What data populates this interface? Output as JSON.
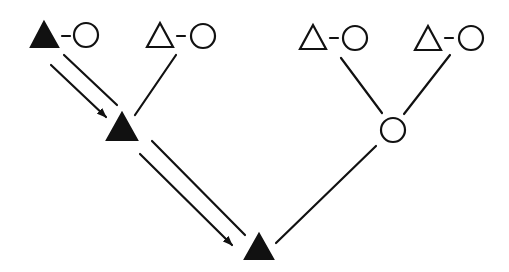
{
  "diagram": {
    "type": "pedigree",
    "colors": {
      "stroke": "#111111",
      "fill_affected": "#111111",
      "background": "#ffffff"
    },
    "nodes": [
      {
        "id": "g1_left_male",
        "shape": "triangle",
        "filled": true,
        "x": 44,
        "y": 35
      },
      {
        "id": "g1_left_female",
        "shape": "circle",
        "filled": false,
        "x": 86,
        "y": 35
      },
      {
        "id": "g1_mid_male",
        "shape": "triangle",
        "filled": false,
        "x": 160,
        "y": 35
      },
      {
        "id": "g1_mid_female",
        "shape": "circle",
        "filled": false,
        "x": 203,
        "y": 35
      },
      {
        "id": "g1_r1_male",
        "shape": "triangle",
        "filled": false,
        "x": 313,
        "y": 37
      },
      {
        "id": "g1_r1_female",
        "shape": "circle",
        "filled": false,
        "x": 355,
        "y": 37
      },
      {
        "id": "g1_r2_male",
        "shape": "triangle",
        "filled": false,
        "x": 428,
        "y": 37
      },
      {
        "id": "g1_r2_female",
        "shape": "circle",
        "filled": false,
        "x": 471,
        "y": 37
      },
      {
        "id": "g2_left_male",
        "shape": "triangle",
        "filled": true,
        "x": 122,
        "y": 127
      },
      {
        "id": "g2_right_female",
        "shape": "circle",
        "filled": false,
        "x": 393,
        "y": 130
      },
      {
        "id": "g3_male",
        "shape": "triangle",
        "filled": true,
        "x": 259,
        "y": 246
      }
    ],
    "edges": [
      {
        "from": "g1_left_male",
        "to": "g1_left_female",
        "type": "marriage"
      },
      {
        "from": "g1_mid_male",
        "to": "g1_mid_female",
        "type": "marriage"
      },
      {
        "from": "g1_r1_male",
        "to": "g1_r1_female",
        "type": "marriage"
      },
      {
        "from": "g1_r2_male",
        "to": "g1_r2_female",
        "type": "marriage"
      },
      {
        "from": "g1_left",
        "to": "g2_left_male",
        "type": "descent-with-arrow"
      },
      {
        "from": "g1_mid",
        "to": "g2_left_male",
        "type": "descent"
      },
      {
        "from": "g1_r1",
        "to": "g2_right_female",
        "type": "descent"
      },
      {
        "from": "g1_r2",
        "to": "g2_right_female",
        "type": "descent"
      },
      {
        "from": "g2_left_male",
        "to": "g3_male",
        "type": "descent-with-arrow"
      },
      {
        "from": "g2_right_female",
        "to": "g3_male",
        "type": "descent"
      }
    ]
  }
}
